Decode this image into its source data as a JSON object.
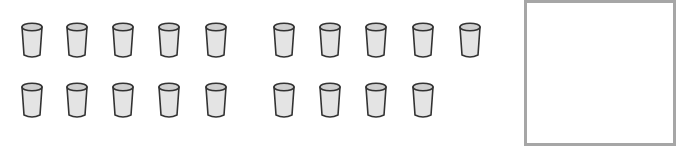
{
  "groups": [
    {
      "name": "left-group",
      "rows": [
        5,
        5
      ]
    },
    {
      "name": "right-group",
      "rows": [
        5,
        4
      ]
    }
  ],
  "total_cups": 19,
  "cup": {
    "icon": "cup-icon",
    "fill_color": "#e4e4e4",
    "rim_color": "#cfcfcf",
    "outline_color": "#333333"
  },
  "answer_box": {
    "value": "",
    "border_color": "#a6a6a6"
  }
}
